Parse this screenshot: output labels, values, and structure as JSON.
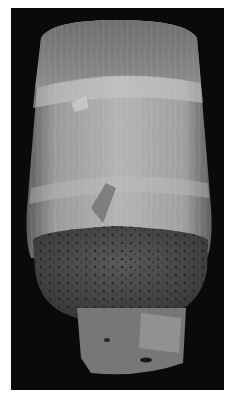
{
  "image": {
    "subject": "SEM micrograph of a fiber with fractured end",
    "colors": {
      "background": "#ffffff",
      "panel": "#0a0a0a",
      "fiber_light": "#b8b8b8",
      "fiber_mid": "#8c8c8c",
      "fracture_dark": "#4a4a4a"
    }
  }
}
